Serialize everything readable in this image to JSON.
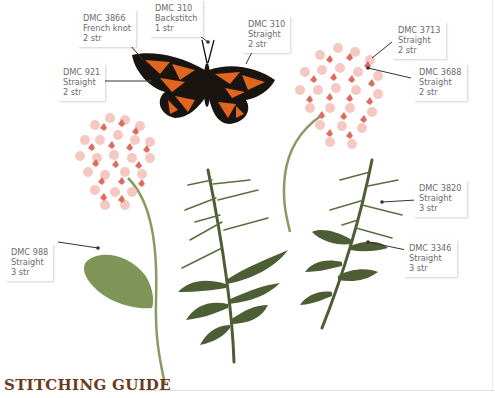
{
  "title": "STITCHING GUIDE",
  "colors": {
    "title": "#6b3a1e",
    "butterfly_orange": "#e0651f",
    "butterfly_black": "#1a1410",
    "flower_light": "#f6c8c2",
    "flower_dark": "#df6b5e",
    "stem_light": "#8a9a62",
    "leaf_light": "#7f9457",
    "leaf_dark": "#4d5e35",
    "bud_yellow": "#e8e4a0"
  },
  "labels": [
    {
      "id": "dmc3866",
      "thread": "DMC 3866",
      "stitch": "French knot",
      "strands": "2 str"
    },
    {
      "id": "dmc310b",
      "thread": "DMC 310",
      "stitch": "Backstitch",
      "strands": "1 str"
    },
    {
      "id": "dmc310s",
      "thread": "DMC 310",
      "stitch": "Straight",
      "strands": "2 str"
    },
    {
      "id": "dmc921",
      "thread": "DMC 921",
      "stitch": "Straight",
      "strands": "2 str"
    },
    {
      "id": "dmc3713",
      "thread": "DMC 3713",
      "stitch": "Straight",
      "strands": "2 str"
    },
    {
      "id": "dmc3688",
      "thread": "DMC 3688",
      "stitch": "Straight",
      "strands": "2 str"
    },
    {
      "id": "dmc3820",
      "thread": "DMC 3820",
      "stitch": "Straight",
      "strands": "3 str"
    },
    {
      "id": "dmc988",
      "thread": "DMC 988",
      "stitch": "Straight",
      "strands": "3 str"
    },
    {
      "id": "dmc3346",
      "thread": "DMC 3346",
      "stitch": "Straight",
      "strands": "3 str"
    }
  ]
}
